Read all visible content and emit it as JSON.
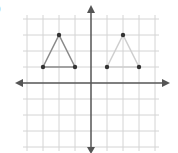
{
  "figure": {
    "label": ")",
    "colors": {
      "grid": "#d4d4d4",
      "axis": "#555555",
      "triangle_a_edge": "#8a8a8a",
      "triangle_b_edge": "#cfcfcf",
      "vertex": "#333333"
    },
    "grid": {
      "origin_px": [
        91,
        83
      ],
      "unit_px": 16,
      "x_range": [
        -4,
        4
      ],
      "y_range": [
        -4,
        4
      ]
    },
    "axes": {
      "x_arrow_left_px": 15,
      "x_arrow_right_px": 170,
      "y_arrow_top_px": 5,
      "y_arrow_bottom_px": 152
    },
    "triangles": [
      {
        "name": "triangle-a",
        "vertices": [
          [
            -3,
            1
          ],
          [
            -2,
            3
          ],
          [
            -1,
            1
          ]
        ]
      },
      {
        "name": "triangle-b",
        "vertices": [
          [
            1,
            1
          ],
          [
            2,
            3
          ],
          [
            3,
            1
          ]
        ]
      }
    ]
  }
}
